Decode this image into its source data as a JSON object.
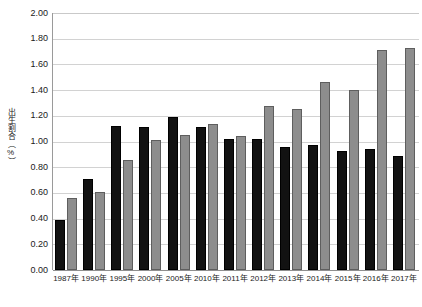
{
  "chart_data": {
    "type": "bar",
    "title": "",
    "subtitle": "",
    "xlabel": "",
    "ylabel": "出生割合（%）",
    "ylim": [
      0.0,
      2.0
    ],
    "ytick_values": [
      0.0,
      0.2,
      0.4,
      0.6,
      0.8,
      1.0,
      1.2,
      1.4,
      1.6,
      1.8,
      2.0
    ],
    "ytick_labels": [
      "0.00",
      "0.20",
      "0.40",
      "0.60",
      "0.80",
      "1.00",
      "1.20",
      "1.40",
      "1.60",
      "1.80",
      "2.00"
    ],
    "grid": true,
    "legend": "none",
    "categories": [
      "1987年",
      "1990年",
      "1995年",
      "2000年",
      "2005年",
      "2010年",
      "2011年",
      "2012年",
      "2013年",
      "2014年",
      "2015年",
      "2016年",
      "2017年"
    ],
    "series": [
      {
        "name": "series-a",
        "color": "#121212",
        "values": [
          0.39,
          0.71,
          1.12,
          1.11,
          1.19,
          1.11,
          1.02,
          1.02,
          0.96,
          0.97,
          0.93,
          0.94,
          0.89
        ]
      },
      {
        "name": "series-b",
        "color": "#8d8d8d",
        "values": [
          0.56,
          0.61,
          0.86,
          1.01,
          1.05,
          1.14,
          1.04,
          1.28,
          1.25,
          1.46,
          1.4,
          1.71,
          1.73
        ]
      }
    ]
  },
  "axis": {
    "y_title": "出生割合（%）"
  }
}
